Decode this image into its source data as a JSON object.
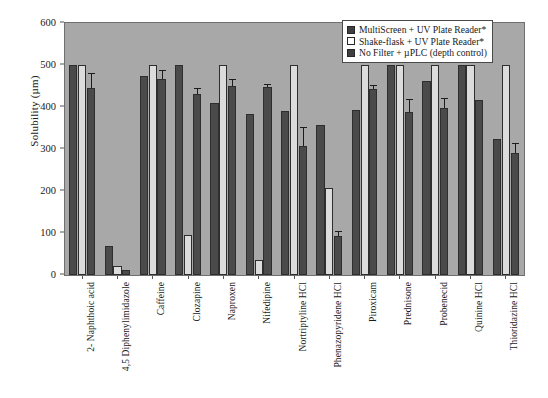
{
  "chart_data": {
    "type": "bar",
    "title": "",
    "xlabel": "",
    "ylabel": "Solubility (µm)",
    "ylim": [
      0,
      600
    ],
    "yticks": [
      0,
      100,
      200,
      300,
      400,
      500,
      600
    ],
    "grid": false,
    "legend_position": "top-right",
    "categories": [
      "2- Naphthoic acid",
      "4,5 Diphenylimidazole",
      "Caffeine",
      "Clozapine",
      "Naproxen",
      "Nifedipine",
      "Nortriptyline HCl",
      "Phenazopyridene HCl",
      "Piroxicam",
      "Prednisone",
      "Probenecid",
      "Quinine HCl",
      "Thioridazine HCl"
    ],
    "series": [
      {
        "name": "MultiScreen + UV Plate Reader*",
        "color": "#4a4a4a",
        "values": [
          500,
          70,
          475,
          500,
          410,
          383,
          390,
          358,
          393,
          500,
          462,
          500,
          325
        ],
        "errors": [
          0,
          0,
          0,
          0,
          0,
          0,
          0,
          0,
          0,
          0,
          0,
          0,
          0
        ]
      },
      {
        "name": "Shake-flask + UV Plate Reader*",
        "color": "#dcdcdc",
        "values": [
          500,
          22,
          500,
          95,
          500,
          35,
          500,
          208,
          500,
          500,
          500,
          500,
          500
        ],
        "errors": [
          0,
          0,
          0,
          0,
          0,
          0,
          0,
          0,
          0,
          0,
          0,
          0,
          0
        ]
      },
      {
        "name": "No Filter + µPLC (depth control)",
        "color": "#4a4a4a",
        "values": [
          445,
          12,
          467,
          430,
          450,
          448,
          308,
          93,
          442,
          388,
          397,
          416,
          290
        ],
        "errors": [
          33,
          0,
          18,
          13,
          14,
          5,
          42,
          9,
          8,
          28,
          22,
          0,
          22
        ]
      }
    ]
  },
  "legend": {
    "items": [
      {
        "label": "MultiScreen + UV Plate Reader*",
        "swatch": "dark"
      },
      {
        "label": "Shake-flask + UV Plate Reader*",
        "swatch": "light"
      },
      {
        "label": "No Filter + µPLC (depth control)",
        "swatch": "dark"
      }
    ]
  },
  "axes": {
    "y_title": "Solubility (µm)"
  }
}
